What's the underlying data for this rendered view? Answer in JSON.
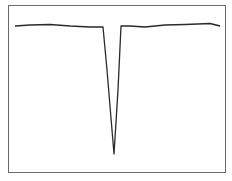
{
  "chart_data": {
    "type": "line",
    "title": "",
    "xlabel": "",
    "ylabel": "",
    "grid": false,
    "legend": null,
    "points": [
      [
        15,
        26
      ],
      [
        30,
        25
      ],
      [
        50,
        24.5
      ],
      [
        70,
        26
      ],
      [
        90,
        27
      ],
      [
        103,
        27
      ],
      [
        107,
        70
      ],
      [
        114,
        154
      ],
      [
        118,
        90
      ],
      [
        121,
        26
      ],
      [
        130,
        26
      ],
      [
        145,
        27
      ],
      [
        165,
        25
      ],
      [
        185,
        24.5
      ],
      [
        210,
        23.5
      ],
      [
        220,
        26
      ]
    ],
    "line_color": "#2a2a2a"
  }
}
